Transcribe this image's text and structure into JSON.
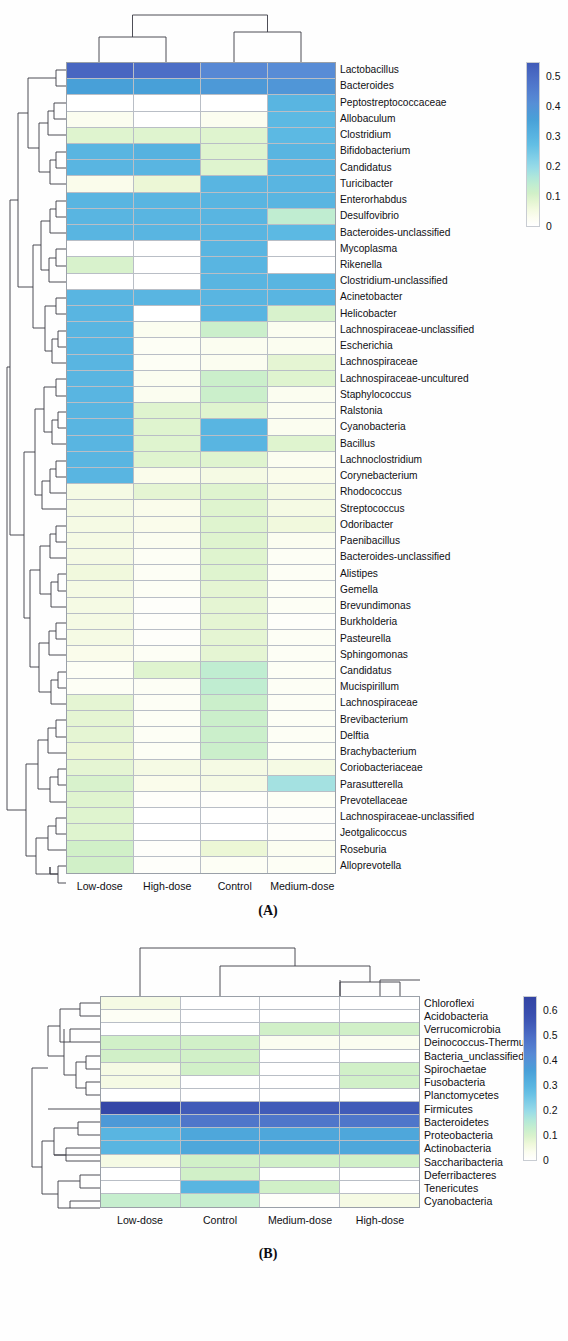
{
  "figure": {
    "panels": [
      {
        "id": "A",
        "caption": "(A)",
        "columns": [
          "Low-dose",
          "High-dose",
          "Control",
          "Medium-dose"
        ],
        "rows": [
          "Lactobacillus",
          "Bacteroides",
          "Peptostreptococcaceae",
          "Allobaculum",
          "Clostridium",
          "Bifidobacterium",
          "Candidatus",
          "Turicibacter",
          "Enterorhabdus",
          "Desulfovibrio",
          "Bacteroides-unclassified",
          "Mycoplasma",
          "Rikenella",
          "Clostridium-unclassified",
          "Acinetobacter",
          "Helicobacter",
          "Lachnospiraceae-unclassified",
          "Escherichia",
          "Lachnospiraceae",
          "Lachnospiraceae-uncultured",
          "Staphylococcus",
          "Ralstonia",
          "Cyanobacteria",
          "Bacillus",
          "Lachnoclostridium",
          "Corynebacterium",
          "Rhodococcus",
          "Streptococcus",
          "Odoribacter",
          "Paenibacillus",
          "Bacteroides-unclassified",
          "Alistipes",
          "Gemella",
          "Brevundimonas",
          "Burkholderia",
          "Pasteurella",
          "Sphingomonas",
          "Candidatus",
          "Mucispirillum",
          "Lachnospiraceae",
          "Brevibacterium",
          "Delftia",
          "Brachybacterium",
          "Coriobacteriaceae",
          "Parasutterella",
          "Prevotellaceae",
          "Lachnospiraceae-unclassified",
          "Jeotgalicoccus",
          "Roseburia",
          "Alloprevotella"
        ],
        "colorbar": {
          "ticks": [
            "0.5",
            "0.4",
            "0.3",
            "0.2",
            "0.1",
            "0"
          ],
          "min": 0,
          "max": 0.55
        },
        "chart_data": {
          "type": "heatmap",
          "title": "Genus-level relative abundance clustered heatmap",
          "xlabel": "",
          "ylabel": "",
          "categories": [
            "Low-dose",
            "High-dose",
            "Control",
            "Medium-dose"
          ],
          "zlim": [
            0,
            0.55
          ],
          "grid": true,
          "legend_position": "right",
          "values": [
            [
              0.52,
              0.5,
              0.43,
              0.42
            ],
            [
              0.36,
              0.36,
              0.38,
              0.39
            ],
            [
              0.0,
              0.0,
              0.0,
              0.3
            ],
            [
              0.03,
              0.0,
              0.03,
              0.29
            ],
            [
              0.09,
              0.09,
              0.09,
              0.29
            ],
            [
              0.3,
              0.31,
              0.09,
              0.3
            ],
            [
              0.3,
              0.3,
              0.09,
              0.3
            ],
            [
              0.04,
              0.07,
              0.3,
              0.3
            ],
            [
              0.3,
              0.3,
              0.3,
              0.3
            ],
            [
              0.3,
              0.3,
              0.3,
              0.14
            ],
            [
              0.3,
              0.3,
              0.3,
              0.29
            ],
            [
              0.0,
              0.0,
              0.3,
              0.0
            ],
            [
              0.1,
              0.0,
              0.3,
              0.0
            ],
            [
              0.0,
              0.0,
              0.3,
              0.3
            ],
            [
              0.3,
              0.3,
              0.3,
              0.3
            ],
            [
              0.3,
              0.0,
              0.3,
              0.1
            ],
            [
              0.3,
              0.03,
              0.12,
              0.03
            ],
            [
              0.3,
              0.02,
              0.03,
              0.03
            ],
            [
              0.3,
              0.02,
              0.03,
              0.08
            ],
            [
              0.3,
              0.03,
              0.12,
              0.09
            ],
            [
              0.3,
              0.03,
              0.12,
              0.03
            ],
            [
              0.3,
              0.09,
              0.09,
              0.03
            ],
            [
              0.3,
              0.09,
              0.3,
              0.03
            ],
            [
              0.3,
              0.09,
              0.3,
              0.09
            ],
            [
              0.3,
              0.09,
              0.09,
              0.03
            ],
            [
              0.3,
              0.04,
              0.05,
              0.04
            ],
            [
              0.05,
              0.08,
              0.09,
              0.05
            ],
            [
              0.05,
              0.04,
              0.09,
              0.05
            ],
            [
              0.05,
              0.04,
              0.09,
              0.06
            ],
            [
              0.05,
              0.03,
              0.09,
              0.03
            ],
            [
              0.05,
              0.02,
              0.09,
              0.02
            ],
            [
              0.06,
              0.02,
              0.09,
              0.02
            ],
            [
              0.05,
              0.02,
              0.08,
              0.02
            ],
            [
              0.05,
              0.01,
              0.08,
              0.02
            ],
            [
              0.05,
              0.01,
              0.08,
              0.01
            ],
            [
              0.05,
              0.01,
              0.08,
              0.02
            ],
            [
              0.04,
              0.02,
              0.08,
              0.02
            ],
            [
              0.02,
              0.09,
              0.14,
              0.02
            ],
            [
              0.02,
              0.02,
              0.14,
              0.02
            ],
            [
              0.08,
              0.02,
              0.12,
              0.02
            ],
            [
              0.08,
              0.02,
              0.12,
              0.02
            ],
            [
              0.08,
              0.02,
              0.12,
              0.02
            ],
            [
              0.07,
              0.02,
              0.12,
              0.02
            ],
            [
              0.08,
              0.05,
              0.05,
              0.05
            ],
            [
              0.1,
              0.04,
              0.05,
              0.18
            ],
            [
              0.09,
              0.01,
              0.01,
              0.02
            ],
            [
              0.09,
              0.0,
              0.0,
              0.01
            ],
            [
              0.09,
              0.0,
              0.0,
              0.01
            ],
            [
              0.11,
              0.01,
              0.07,
              0.03
            ],
            [
              0.11,
              0.01,
              0.02,
              0.02
            ]
          ]
        }
      },
      {
        "id": "B",
        "caption": "(B)",
        "columns": [
          "Low-dose",
          "Control",
          "Medium-dose",
          "High-dose"
        ],
        "rows": [
          "Chloroflexi",
          "Acidobacteria",
          "Verrucomicrobia",
          "Deinococcus-Thermus",
          "Bacteria_unclassified",
          "Spirochaetae",
          "Fusobacteria",
          "Planctomycetes",
          "Firmicutes",
          "Bacteroidetes",
          "Proteobacteria",
          "Actinobacteria",
          "Saccharibacteria",
          "Deferribacteres",
          "Tenericutes",
          "Cyanobacteria"
        ],
        "colorbar": {
          "ticks": [
            "0.6",
            "0.5",
            "0.4",
            "0.3",
            "0.2",
            "0.1",
            "0"
          ],
          "min": 0,
          "max": 0.66
        },
        "chart_data": {
          "type": "heatmap",
          "title": "Phylum-level relative abundance clustered heatmap",
          "xlabel": "",
          "ylabel": "",
          "categories": [
            "Low-dose",
            "Control",
            "Medium-dose",
            "High-dose"
          ],
          "zlim": [
            0,
            0.66
          ],
          "grid": true,
          "legend_position": "right",
          "values": [
            [
              0.05,
              0.0,
              0.0,
              0.0
            ],
            [
              0.02,
              0.0,
              0.0,
              0.0
            ],
            [
              0.0,
              0.0,
              0.11,
              0.11
            ],
            [
              0.11,
              0.11,
              0.03,
              0.03
            ],
            [
              0.11,
              0.11,
              0.0,
              0.0
            ],
            [
              0.05,
              0.11,
              0.0,
              0.11
            ],
            [
              0.05,
              0.0,
              0.0,
              0.11
            ],
            [
              0.0,
              0.0,
              0.0,
              0.0
            ],
            [
              0.64,
              0.55,
              0.55,
              0.55
            ],
            [
              0.38,
              0.48,
              0.48,
              0.48
            ],
            [
              0.3,
              0.34,
              0.34,
              0.34
            ],
            [
              0.3,
              0.34,
              0.34,
              0.34
            ],
            [
              0.05,
              0.11,
              0.11,
              0.11
            ],
            [
              0.0,
              0.11,
              0.0,
              0.0
            ],
            [
              0.0,
              0.3,
              0.11,
              0.0
            ],
            [
              0.13,
              0.13,
              0.01,
              0.05
            ]
          ]
        }
      }
    ]
  }
}
